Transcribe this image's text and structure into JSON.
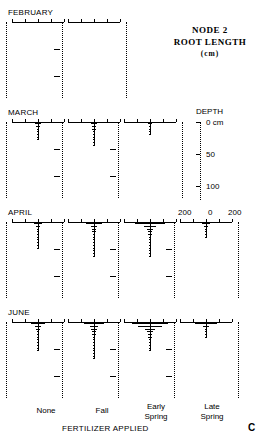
{
  "figure": {
    "panel_letter": "C",
    "title_line1": "NODE 2",
    "title_line2": "ROOT LENGTH",
    "title_units": "(cm)",
    "x_axis_title": "FERTILIZER APPLIED",
    "depth_axis_title": "DEPTH",
    "depth_unit_label": "0  cm",
    "depth_tick_50": "50",
    "depth_tick_100": "100",
    "scale_left": "200",
    "scale_center": "0",
    "scale_right": "200"
  },
  "columns": [
    {
      "id": "none",
      "label_line1": "None",
      "label_line2": ""
    },
    {
      "id": "fall",
      "label_line1": "Fall",
      "label_line2": ""
    },
    {
      "id": "early-spring",
      "label_line1": "Early",
      "label_line2": "Spring"
    },
    {
      "id": "late-spring",
      "label_line1": "Late",
      "label_line2": "Spring"
    }
  ],
  "rows": [
    {
      "id": "february",
      "label": "FEBRUARY",
      "active_columns": 2
    },
    {
      "id": "march",
      "label": "MARCH",
      "active_columns": 3
    },
    {
      "id": "april",
      "label": "APRIL",
      "active_columns": 4
    },
    {
      "id": "june",
      "label": "JUNE",
      "active_columns": 4
    }
  ],
  "chart_data": {
    "type": "bar",
    "title": "NODE 2 ROOT LENGTH (cm)",
    "xlabel": "FERTILIZER APPLIED",
    "ylabel": "DEPTH",
    "orientation": "horizontal-mirrored-depth-profile",
    "xlim": [
      -200,
      200
    ],
    "ylim": [
      0,
      140
    ],
    "x_ticks": [
      -200,
      -100,
      0,
      100,
      200
    ],
    "y_ticks": [
      0,
      50,
      100
    ],
    "y_tick_labels": [
      "0  cm",
      "50",
      "100"
    ],
    "grid": false,
    "legend": null,
    "categories": [
      "None",
      "Fall",
      "Early Spring",
      "Late Spring"
    ],
    "depths_cm": [
      2,
      7,
      12,
      17,
      22,
      27,
      32,
      37,
      42,
      47,
      52,
      57,
      62,
      67,
      72,
      77,
      82,
      87,
      92,
      97
    ],
    "series": [
      {
        "name": "FEBRUARY",
        "panels": [
          {
            "category": "None",
            "values": [
              0,
              0,
              0,
              0,
              0,
              0,
              0,
              0,
              0,
              0,
              0,
              0,
              0,
              0,
              0,
              0,
              0,
              0,
              0,
              0
            ]
          },
          {
            "category": "Fall",
            "values": [
              0,
              0,
              0,
              0,
              0,
              0,
              0,
              0,
              0,
              0,
              0,
              0,
              0,
              0,
              0,
              0,
              0,
              0,
              0,
              0
            ]
          },
          {
            "category": "Early Spring",
            "values": null
          },
          {
            "category": "Late Spring",
            "values": null
          }
        ]
      },
      {
        "name": "MARCH",
        "panels": [
          {
            "category": "None",
            "values": [
              22,
              14,
              9,
              6,
              4,
              3,
              2,
              0,
              0,
              0,
              0,
              0,
              0,
              0,
              0,
              0,
              0,
              0,
              0,
              0
            ]
          },
          {
            "category": "Fall",
            "values": [
              26,
              18,
              12,
              8,
              6,
              5,
              4,
              3,
              2,
              0,
              0,
              0,
              0,
              0,
              0,
              0,
              0,
              0,
              0,
              0
            ]
          },
          {
            "category": "Early Spring",
            "values": [
              12,
              8,
              5,
              3,
              2,
              0,
              0,
              0,
              0,
              0,
              0,
              0,
              0,
              0,
              0,
              0,
              0,
              0,
              0,
              0
            ]
          },
          {
            "category": "Late Spring",
            "values": null
          }
        ]
      },
      {
        "name": "APRIL",
        "panels": [
          {
            "category": "None",
            "values": [
              30,
              16,
              11,
              9,
              7,
              6,
              5,
              4,
              3,
              2,
              0,
              0,
              0,
              0,
              0,
              0,
              0,
              0,
              0,
              0
            ]
          },
          {
            "category": "Fall",
            "values": [
              62,
              26,
              18,
              14,
              11,
              9,
              8,
              7,
              6,
              5,
              4,
              3,
              2,
              0,
              0,
              0,
              0,
              0,
              0,
              0
            ]
          },
          {
            "category": "Early Spring",
            "values": [
              118,
              46,
              22,
              16,
              13,
              11,
              9,
              8,
              7,
              6,
              5,
              4,
              3,
              0,
              0,
              0,
              0,
              0,
              0,
              0
            ]
          },
          {
            "category": "Late Spring",
            "values": [
              34,
              13,
              8,
              5,
              3,
              2,
              0,
              0,
              0,
              0,
              0,
              0,
              0,
              0,
              0,
              0,
              0,
              0,
              0,
              0
            ]
          }
        ]
      },
      {
        "name": "JUNE",
        "panels": [
          {
            "category": "None",
            "values": [
              56,
              22,
              14,
              11,
              9,
              8,
              7,
              6,
              5,
              4,
              3,
              0,
              0,
              0,
              0,
              0,
              0,
              0,
              0,
              0
            ]
          },
          {
            "category": "Fall",
            "values": [
              76,
              34,
              20,
              15,
              12,
              10,
              9,
              8,
              7,
              6,
              5,
              4,
              3,
              2,
              0,
              0,
              0,
              0,
              0,
              0
            ]
          },
          {
            "category": "Early Spring",
            "values": [
              140,
              92,
              40,
              22,
              16,
              12,
              10,
              8,
              6,
              4,
              3,
              0,
              0,
              0,
              0,
              0,
              0,
              0,
              0,
              0
            ]
          },
          {
            "category": "Late Spring",
            "values": [
              86,
              20,
              11,
              7,
              5,
              3,
              0,
              0,
              0,
              0,
              0,
              0,
              0,
              0,
              0,
              0,
              0,
              0,
              0,
              0
            ]
          }
        ]
      }
    ]
  }
}
